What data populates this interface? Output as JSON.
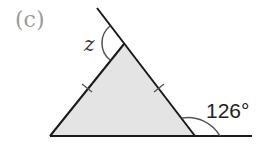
{
  "figure": {
    "part_label": "(c)",
    "unknown_angle_label": "z",
    "given_angle_label": "126°"
  },
  "colors": {
    "triangle_fill": "#e4e4e4",
    "line": "#1a1a1a",
    "part_label": "#9a9a9a"
  }
}
